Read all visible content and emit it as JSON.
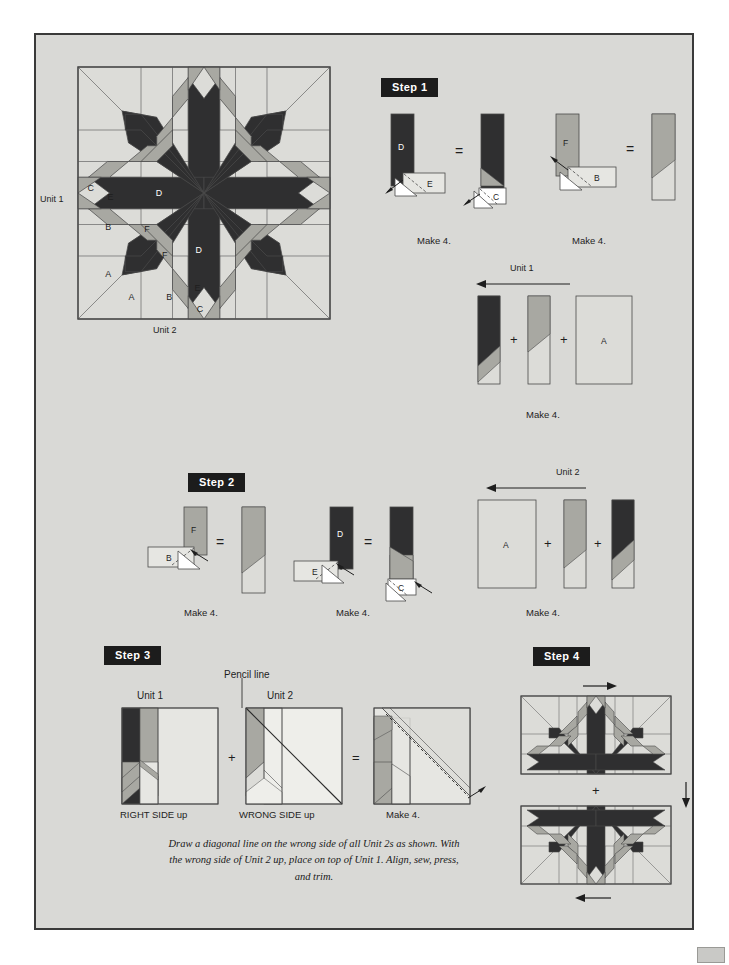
{
  "page": {
    "background": "#d9d9d6",
    "border_color": "#3a3a3a"
  },
  "palette": {
    "dark": "#2f2f30",
    "medium": "#a8a8a2",
    "light": "#dcdcd8",
    "lighter": "#e6e6e2",
    "outline": "#4a4a4a",
    "badge_bg": "#1c1c1c",
    "badge_text": "#ffffff"
  },
  "block_diagram": {
    "name": "feathered-star-block",
    "unit1_label": "Unit 1",
    "unit2_label": "Unit 2",
    "piece_labels": [
      "C",
      "E",
      "D",
      "B",
      "F",
      "F",
      "D",
      "A",
      "A",
      "B",
      "E",
      "C"
    ]
  },
  "steps": [
    {
      "id": "step1",
      "badge": "Step 1",
      "groups": [
        {
          "name": "d-e-c-strip",
          "labels": [
            "D",
            "E",
            "C"
          ],
          "caption": "Make 4."
        },
        {
          "name": "f-b-strip",
          "labels": [
            "F",
            "B"
          ],
          "caption": "Make 4."
        }
      ],
      "assembly": {
        "name": "unit-1-assembly",
        "title": "Unit 1",
        "caption": "Make 4.",
        "piece_label": "A",
        "operators": [
          "+",
          "+"
        ]
      }
    },
    {
      "id": "step2",
      "badge": "Step 2",
      "groups": [
        {
          "name": "f-b-strip",
          "labels": [
            "F",
            "B"
          ],
          "caption": "Make 4."
        },
        {
          "name": "d-e-c-strip",
          "labels": [
            "D",
            "E",
            "C"
          ],
          "caption": "Make 4."
        }
      ],
      "assembly": {
        "name": "unit-2-assembly",
        "title": "Unit 2",
        "caption": "Make 4.",
        "piece_label": "A",
        "operators": [
          "+",
          "+"
        ]
      }
    },
    {
      "id": "step3",
      "badge": "Step 3",
      "pencil_label": "Pencil line",
      "unit1_title": "Unit 1",
      "unit2_title": "Unit 2",
      "unit1_caption": "RIGHT SIDE up",
      "unit2_caption": "WRONG SIDE up",
      "result_caption": "Make 4.",
      "operators": [
        "+",
        "="
      ],
      "note": "Draw a diagonal line on the wrong side of all Unit 2s as shown. With the wrong side of Unit 2 up, place on top of Unit 1. Align, sew, press, and trim."
    },
    {
      "id": "step4",
      "badge": "Step 4",
      "operator": "+"
    }
  ]
}
